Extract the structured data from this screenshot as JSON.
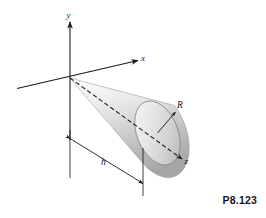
{
  "figure": {
    "number": "P8.123",
    "axes": {
      "x_label": "x",
      "y_label": "y",
      "z_label": "z"
    },
    "dimensions": {
      "radius_label": "R",
      "height_label": "h"
    },
    "colors": {
      "line": "#1a1a1a",
      "cone_light": "#f2f2f2",
      "cone_mid": "#d8d8d8",
      "cone_dark": "#9e9e9e",
      "face_light": "#ededed",
      "face_dark": "#c4c4c4",
      "background": "#ffffff"
    }
  }
}
